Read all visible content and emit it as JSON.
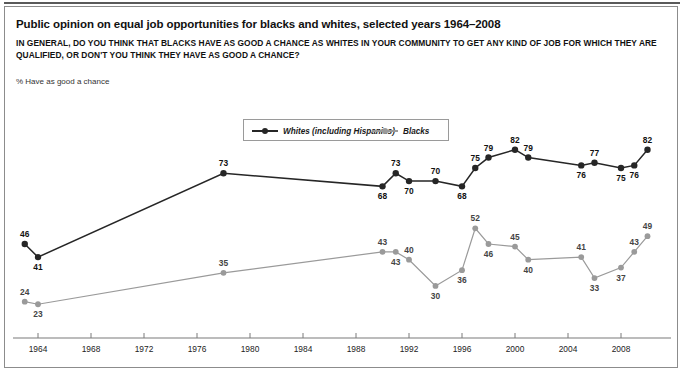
{
  "title": "Public opinion on equal job opportunities for blacks and whites, selected years 1964–2008",
  "subtitle": "IN GENERAL, DO YOU THINK THAT BLACKS HAVE AS GOOD A CHANCE AS WHITES IN YOUR COMMUNITY TO GET ANY KIND OF JOB FOR WHICH THEY ARE QUALIFIED, OR DON'T YOU THINK THEY HAVE AS GOOD A CHANCE?",
  "axis_note": "% Have as good a chance",
  "colors": {
    "whites": "#262626",
    "blacks": "#9a9a9a",
    "frame": "#8c8c8c",
    "axis": "#7a7a7a",
    "text": "#111111"
  },
  "chart_data": {
    "type": "line",
    "title": "Public opinion on equal job opportunities for blacks and whites, selected years 1964–2008",
    "subtitle": "IN GENERAL, DO YOU THINK THAT BLACKS HAVE AS GOOD A CHANCE AS WHITES IN YOUR COMMUNITY TO GET ANY KIND OF JOB FOR WHICH THEY ARE QUALIFIED, OR DON'T YOU THINK THEY HAVE AS GOOD A CHANCE?",
    "xlabel": "",
    "ylabel": "% Have as good a chance",
    "xlim": [
      1962,
      2010
    ],
    "ylim": [
      20,
      85
    ],
    "grid": false,
    "legend_position": "top-center",
    "xticks": [
      1964,
      1968,
      1972,
      1976,
      1980,
      1984,
      1988,
      1992,
      1996,
      2000,
      2004,
      2008
    ],
    "series": [
      {
        "name": "Whites (including Hispanics)",
        "color": "#262626",
        "points": [
          {
            "year": 1963,
            "value": 46,
            "label_pos": "above"
          },
          {
            "year": 1964,
            "value": 41,
            "label_pos": "below"
          },
          {
            "year": 1978,
            "value": 73,
            "label_pos": "above"
          },
          {
            "year": 1990,
            "value": 68,
            "label_pos": "below"
          },
          {
            "year": 1991,
            "value": 73,
            "label_pos": "above"
          },
          {
            "year": 1992,
            "value": 70,
            "label_pos": "below"
          },
          {
            "year": 1994,
            "value": 70,
            "label_pos": "above"
          },
          {
            "year": 1996,
            "value": 68,
            "label_pos": "below"
          },
          {
            "year": 1997,
            "value": 75,
            "label_pos": "above"
          },
          {
            "year": 1998,
            "value": 79,
            "label_pos": "above"
          },
          {
            "year": 2000,
            "value": 82,
            "label_pos": "above"
          },
          {
            "year": 2001,
            "value": 79,
            "label_pos": "above"
          },
          {
            "year": 2005,
            "value": 76,
            "label_pos": "below"
          },
          {
            "year": 2006,
            "value": 77,
            "label_pos": "above"
          },
          {
            "year": 2008,
            "value": 75,
            "label_pos": "below"
          },
          {
            "year": 2009,
            "value": 76,
            "label_pos": "below"
          },
          {
            "year": 2010,
            "value": 82,
            "label_pos": "above"
          }
        ]
      },
      {
        "name": "Blacks",
        "color": "#9a9a9a",
        "points": [
          {
            "year": 1963,
            "value": 24,
            "label_pos": "above"
          },
          {
            "year": 1964,
            "value": 23,
            "label_pos": "below"
          },
          {
            "year": 1978,
            "value": 35,
            "label_pos": "above"
          },
          {
            "year": 1990,
            "value": 43,
            "label_pos": "above"
          },
          {
            "year": 1991,
            "value": 43,
            "label_pos": "below"
          },
          {
            "year": 1992,
            "value": 40,
            "label_pos": "above"
          },
          {
            "year": 1994,
            "value": 30,
            "label_pos": "below"
          },
          {
            "year": 1996,
            "value": 36,
            "label_pos": "below"
          },
          {
            "year": 1997,
            "value": 52,
            "label_pos": "above"
          },
          {
            "year": 1998,
            "value": 46,
            "label_pos": "below"
          },
          {
            "year": 2000,
            "value": 45,
            "label_pos": "above"
          },
          {
            "year": 2001,
            "value": 40,
            "label_pos": "below"
          },
          {
            "year": 2005,
            "value": 41,
            "label_pos": "above"
          },
          {
            "year": 2006,
            "value": 33,
            "label_pos": "below"
          },
          {
            "year": 2008,
            "value": 37,
            "label_pos": "below"
          },
          {
            "year": 2009,
            "value": 43,
            "label_pos": "above"
          },
          {
            "year": 2010,
            "value": 49,
            "label_pos": "above"
          }
        ]
      }
    ]
  }
}
